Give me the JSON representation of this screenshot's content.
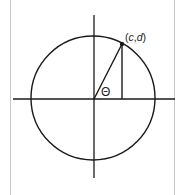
{
  "diagram": {
    "type": "unit-circle",
    "point_label": "(c,d)",
    "point_label_parts": {
      "open": "(",
      "c": "c",
      "sep": ",",
      "d": "d",
      "close": ")"
    },
    "angle_label": "Θ",
    "colors": {
      "stroke": "#1a1a1a",
      "frame": "#c8c8c8",
      "background": "#ffffff"
    },
    "geometry": {
      "center": [
        93,
        99
      ],
      "radius": 62,
      "point": [
        122,
        44
      ],
      "x_axis": [
        13,
        175
      ],
      "y_axis": [
        15,
        178
      ]
    }
  }
}
